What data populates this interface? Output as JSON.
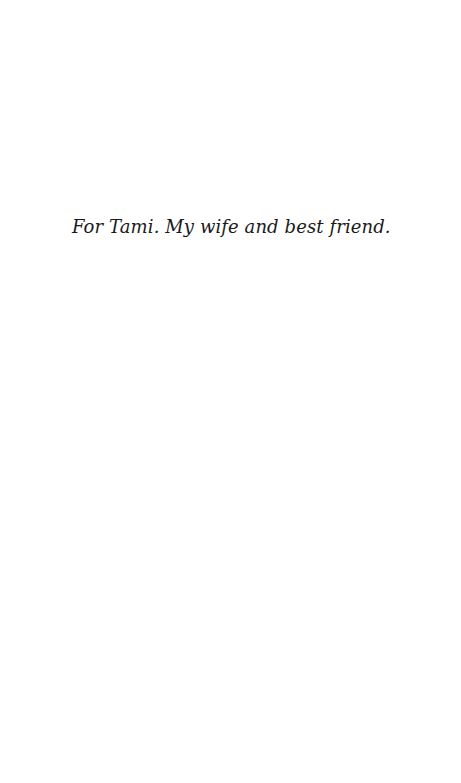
{
  "page": {
    "type": "dedication",
    "background_color": "#ffffff",
    "text_color": "#1a1a1a"
  },
  "dedication": {
    "text": "For Tami. My wife and best friend."
  }
}
